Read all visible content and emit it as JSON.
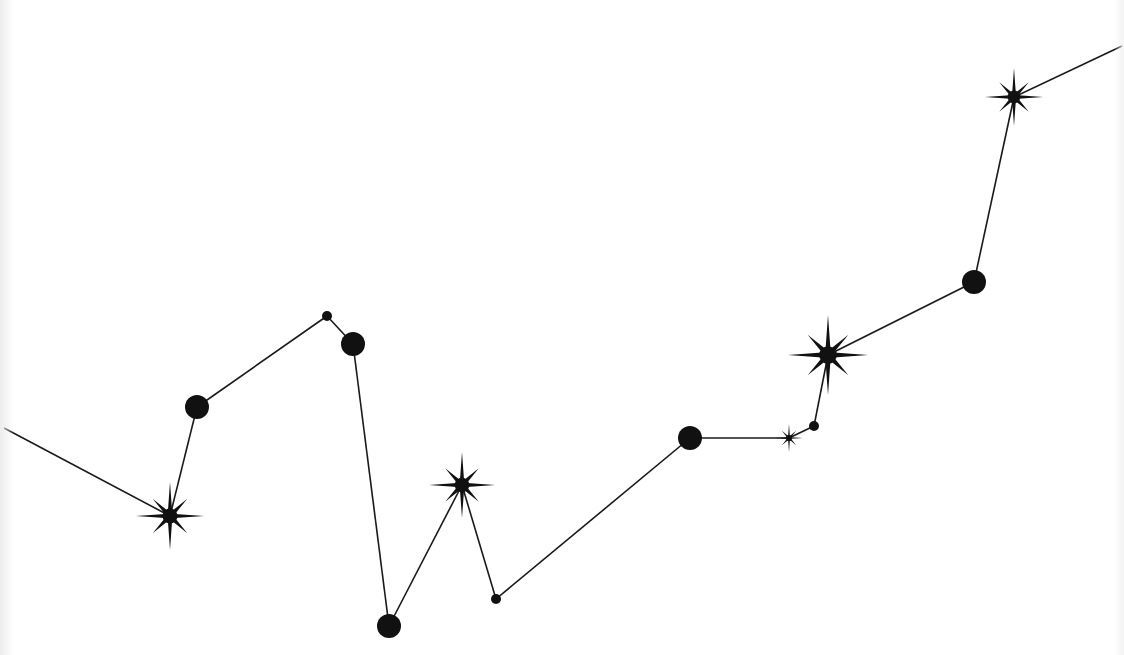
{
  "figure": {
    "title": "",
    "background": "#ffffff",
    "line_color": "#1a1a1a",
    "node_color": "#111111",
    "line_width": 1.6
  },
  "nodes": [
    {
      "id": "n0",
      "type": "edge",
      "x": 4,
      "y": 428
    },
    {
      "id": "n1",
      "type": "star",
      "x": 170,
      "y": 516,
      "r": 34
    },
    {
      "id": "n2",
      "type": "dot",
      "x": 197,
      "y": 407,
      "r": 12
    },
    {
      "id": "n3",
      "type": "dot",
      "x": 327,
      "y": 316,
      "r": 5
    },
    {
      "id": "n4",
      "type": "dot",
      "x": 353,
      "y": 344,
      "r": 12
    },
    {
      "id": "n5",
      "type": "dot",
      "x": 389,
      "y": 626,
      "r": 12
    },
    {
      "id": "n6",
      "type": "star",
      "x": 462,
      "y": 485,
      "r": 33
    },
    {
      "id": "n7",
      "type": "dot",
      "x": 496,
      "y": 599,
      "r": 5
    },
    {
      "id": "n8",
      "type": "dot",
      "x": 690,
      "y": 438,
      "r": 12
    },
    {
      "id": "n9",
      "type": "star",
      "x": 789,
      "y": 438,
      "r": 14
    },
    {
      "id": "n10",
      "type": "dot",
      "x": 814,
      "y": 426,
      "r": 5
    },
    {
      "id": "n11",
      "type": "star",
      "x": 828,
      "y": 355,
      "r": 40
    },
    {
      "id": "n12",
      "type": "dot",
      "x": 974,
      "y": 282,
      "r": 12
    },
    {
      "id": "n13",
      "type": "star",
      "x": 1014,
      "y": 97,
      "r": 29
    },
    {
      "id": "n14",
      "type": "edge",
      "x": 1122,
      "y": 46
    }
  ],
  "edges": [
    [
      "n0",
      "n1"
    ],
    [
      "n1",
      "n2"
    ],
    [
      "n2",
      "n3"
    ],
    [
      "n3",
      "n4"
    ],
    [
      "n4",
      "n5"
    ],
    [
      "n5",
      "n6"
    ],
    [
      "n6",
      "n7"
    ],
    [
      "n7",
      "n8"
    ],
    [
      "n8",
      "n9"
    ],
    [
      "n9",
      "n10"
    ],
    [
      "n10",
      "n11"
    ],
    [
      "n11",
      "n12"
    ],
    [
      "n12",
      "n13"
    ],
    [
      "n13",
      "n14"
    ]
  ]
}
